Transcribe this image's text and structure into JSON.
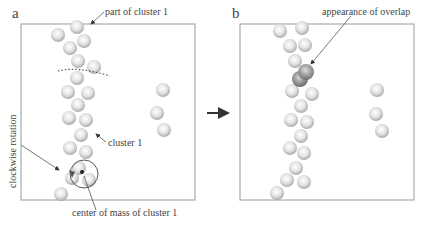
{
  "panels": {
    "a": {
      "label": "a",
      "annotations": {
        "part_of_cluster": "part of cluster 1",
        "cluster": "cluster 1",
        "center_of_mass": "center of mass of cluster 1",
        "rotation": "clockwise rotation"
      }
    },
    "b": {
      "label": "b",
      "annotations": {
        "overlap": "appearance of overlap"
      }
    }
  },
  "transition_arrow": "right-arrow",
  "colors": {
    "frame": "#9a9a9a",
    "sphere_fill": "#d9d9d9",
    "sphere_edge": "#a8a8a8",
    "overlap_sphere": "#8c8c8c",
    "arrow": "#333333"
  }
}
